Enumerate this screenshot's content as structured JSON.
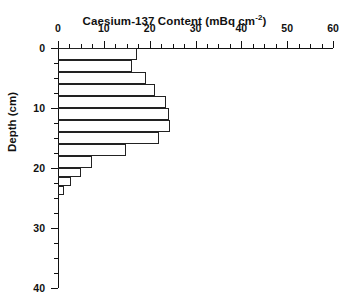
{
  "chart_data": {
    "type": "bar",
    "orientation": "horizontal",
    "title": "Caesium-137 Content (mBq cm",
    "title_sup": "-2",
    "title_tail": ")",
    "title_full": "Caesium-137 Content (mBq cm-2)",
    "xlabel": "Caesium-137 Content (mBq cm-2)",
    "ylabel": "Depth (cm)",
    "xlim": [
      0,
      60
    ],
    "ylim": [
      0,
      40
    ],
    "x_ticks": [
      0,
      10,
      20,
      30,
      40,
      50,
      60
    ],
    "x_tick_labels": [
      "0",
      "10",
      "20",
      "30",
      "40",
      "50",
      "60"
    ],
    "x_minor_step": 2.5,
    "y_ticks": [
      0,
      10,
      20,
      30,
      40
    ],
    "y_tick_labels": [
      "0",
      "10",
      "20",
      "30",
      "40"
    ],
    "y_minor_step": 2.5,
    "y_axis_direction": "inverted",
    "grid": false,
    "legend": null,
    "bar_fill": "none",
    "bar_edge_color": "#222222",
    "depth_intervals": [
      [
        0,
        2
      ],
      [
        2,
        4
      ],
      [
        4,
        6
      ],
      [
        6,
        8
      ],
      [
        8,
        10
      ],
      [
        10,
        12
      ],
      [
        12,
        14
      ],
      [
        14,
        16
      ],
      [
        16,
        18
      ],
      [
        18,
        20
      ],
      [
        20,
        21.5
      ],
      [
        21.5,
        23
      ],
      [
        23,
        24.5
      ]
    ],
    "values": [
      17.3,
      16.2,
      19.3,
      21.2,
      23.5,
      24.2,
      24.5,
      22.0,
      14.8,
      7.5,
      5.0,
      2.8,
      1.2
    ],
    "categories": [
      "0-2",
      "2-4",
      "4-6",
      "6-8",
      "8-10",
      "10-12",
      "12-14",
      "14-16",
      "16-18",
      "18-20",
      "20-21.5",
      "21.5-23",
      "23-24.5"
    ],
    "units": "mBq cm-2",
    "depth_units": "cm"
  },
  "colors": {
    "axis": "#111111",
    "bar_edge": "#222222",
    "background": "#ffffff"
  }
}
